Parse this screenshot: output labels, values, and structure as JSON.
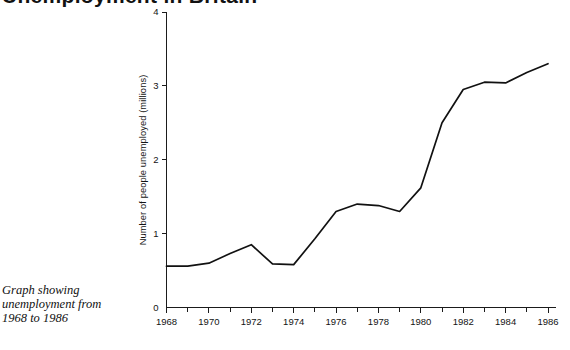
{
  "title": {
    "text": "Unemployment in Britain",
    "visible_fragment": "cropped top sliver"
  },
  "caption": {
    "line1": "Graph showing",
    "line2": "unemployment from",
    "line3": "1968 to 1986"
  },
  "chart_data": {
    "type": "line",
    "title": "",
    "xlabel": "",
    "ylabel": "Number of people unemployed (millions)",
    "xlim": [
      1968,
      1986
    ],
    "ylim": [
      0,
      4
    ],
    "grid": false,
    "legend": "none",
    "x_major_ticks": [
      "1968",
      "1970",
      "1972",
      "1974",
      "1976",
      "1978",
      "1980",
      "1982",
      "1984",
      "1986"
    ],
    "x_minor_ticks": [
      "1969",
      "1971",
      "1973",
      "1975",
      "1977",
      "1979",
      "1981",
      "1983",
      "1985"
    ],
    "y_ticks": [
      "0",
      "1",
      "2",
      "3",
      "4"
    ],
    "x": [
      1968,
      1969,
      1970,
      1971,
      1972,
      1973,
      1974,
      1975,
      1976,
      1977,
      1978,
      1979,
      1980,
      1981,
      1982,
      1983,
      1984,
      1985,
      1986
    ],
    "series": [
      {
        "name": "People unemployed (millions)",
        "color": "#111111",
        "values": [
          0.56,
          0.56,
          0.6,
          0.73,
          0.85,
          0.59,
          0.58,
          0.93,
          1.3,
          1.4,
          1.38,
          1.3,
          1.62,
          2.5,
          2.95,
          3.05,
          3.04,
          3.18,
          3.3
        ]
      }
    ]
  },
  "axes": {
    "y_tick_labels": [
      "0",
      "1",
      "2",
      "3",
      "4"
    ],
    "y_axis_title": "Number of people unemployed (millions)",
    "x_tick_labels": [
      "1968",
      "1970",
      "1972",
      "1974",
      "1976",
      "1978",
      "1980",
      "1982",
      "1984",
      "1986"
    ]
  }
}
